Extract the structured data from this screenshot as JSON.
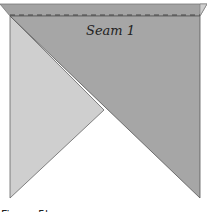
{
  "diagram": {
    "seam_label": "Seam 1",
    "caption": "Figure 5b",
    "colors": {
      "dark_fabric": "#a6a6a6",
      "light_fabric": "#cfcfcf",
      "band": "#a0a0a0",
      "edge": "#555555",
      "seam_line": "#444444"
    }
  }
}
